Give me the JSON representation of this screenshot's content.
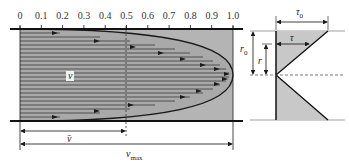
{
  "axis": {
    "ticks": [
      "0",
      "0.1",
      "0.2",
      "0.3",
      "0.4",
      "0.5",
      "0.6",
      "0.7",
      "0.8",
      "0.9",
      "1.0"
    ]
  },
  "labels": {
    "velocity": "v",
    "mean_velocity": "v̄",
    "max_velocity": "v",
    "max_velocity_sub": "max",
    "tau0": "τ",
    "tau0_sub": "0",
    "tau": "τ",
    "r0": "r",
    "r0_sub": "0",
    "r": "r"
  },
  "colors": {
    "fill": "#b4b4b4",
    "line": "#1a1a1a",
    "shear_fill": "#c8c8c8"
  }
}
